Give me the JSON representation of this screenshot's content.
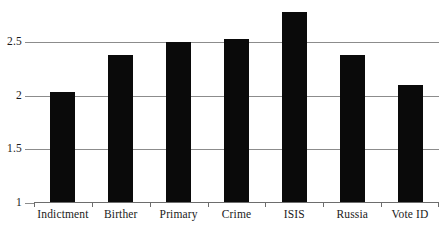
{
  "chart_data": {
    "type": "bar",
    "title": "",
    "subtitle": "",
    "xlabel": "",
    "ylabel": "",
    "categories": [
      "Indictment",
      "Birther",
      "Primary",
      "Crime",
      "ISIS",
      "Russia",
      "Vote ID"
    ],
    "values": [
      2.03,
      2.37,
      2.49,
      2.52,
      2.77,
      2.37,
      2.09
    ],
    "series": [
      {
        "name": "",
        "values": [
          2.03,
          2.37,
          2.49,
          2.52,
          2.77,
          2.37,
          2.09
        ]
      }
    ],
    "ylim": [
      1,
      2.82
    ],
    "yticks": [
      1,
      1.5,
      2,
      2.5
    ],
    "ytick_labels": [
      "1",
      "1.5",
      "2",
      "2.5"
    ],
    "grid": true,
    "grid_axis": "y",
    "legend": false,
    "legend_position": "none",
    "bar_color": "#0a0a0a",
    "gridline_color": "#8c8c8c",
    "axis_color": "#6d6d6d",
    "background_color": "#ffffff",
    "annotations": []
  },
  "axes": {
    "y_ticks": [
      {
        "label": "2.5",
        "value": 2.5
      },
      {
        "label": "2",
        "value": 2
      },
      {
        "label": "1.5",
        "value": 1.5
      },
      {
        "label": "1",
        "value": 1
      }
    ],
    "x_ticks": [
      {
        "label": "Indictment"
      },
      {
        "label": "Birther"
      },
      {
        "label": "Primary"
      },
      {
        "label": "Crime"
      },
      {
        "label": "ISIS"
      },
      {
        "label": "Russia"
      },
      {
        "label": "Vote ID"
      }
    ]
  }
}
